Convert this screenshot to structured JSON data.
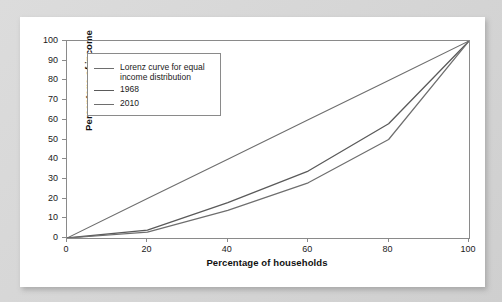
{
  "figure": {
    "background_color": "#d9d9d9",
    "card_color": "#ffffff",
    "axis_color": "#8a8a8a"
  },
  "chart_data": {
    "type": "line",
    "title": "",
    "xlabel": "Percentage of households",
    "ylabel": "Percentage of income",
    "xlim": [
      0,
      100
    ],
    "ylim": [
      0,
      100
    ],
    "xticks": [
      0,
      20,
      40,
      60,
      80,
      100
    ],
    "yticks": [
      0,
      10,
      20,
      30,
      40,
      50,
      60,
      70,
      80,
      90,
      100
    ],
    "grid": false,
    "legend_position": "upper-left-inside",
    "x": [
      0,
      20,
      40,
      60,
      80,
      100
    ],
    "series": [
      {
        "name": "Lorenz curve for equal\nincome distribution",
        "color": "#6e6e6e",
        "width": 1.1,
        "values": [
          0,
          20,
          40,
          60,
          80,
          100
        ]
      },
      {
        "name": "1968",
        "color": "#5a5a5a",
        "width": 1.3,
        "values": [
          0,
          4,
          18,
          34,
          58,
          100
        ]
      },
      {
        "name": "2010",
        "color": "#6e6e6e",
        "width": 1.2,
        "values": [
          0,
          3,
          14,
          28,
          50,
          100
        ]
      }
    ]
  },
  "axes": {
    "y_tick_labels": [
      "100",
      "90",
      "80",
      "70",
      "60",
      "50",
      "40",
      "30",
      "20",
      "10",
      "0"
    ],
    "x_tick_labels": [
      "0",
      "20",
      "40",
      "60",
      "80",
      "100"
    ],
    "y_title": "Percentage of income",
    "x_title": "Percentage of households"
  },
  "legend": {
    "entries": [
      {
        "label": "Lorenz curve for equal\nincome distribution",
        "color": "#6e6e6e",
        "width": "1.1px"
      },
      {
        "label": "1968",
        "color": "#5a5a5a",
        "width": "1.4px"
      },
      {
        "label": "2010",
        "color": "#6e6e6e",
        "width": "1.2px"
      }
    ]
  }
}
